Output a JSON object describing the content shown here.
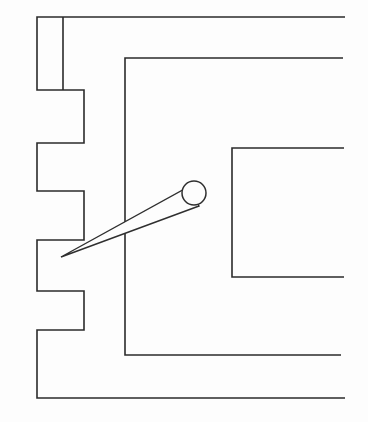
{
  "image": {
    "title": "Scanned line drawing",
    "subject": "floor-plan-outline-with-pointer",
    "width": 368,
    "height": 422,
    "background_color": "#fdfdfd",
    "line_color": "#2b2b2b",
    "style": "monochrome technical line drawing, scanned/faxed appearance",
    "text_labels": []
  },
  "geometry": {
    "outer_wall": {
      "name": "stepped-outer-wall",
      "description": "Open polyline forming the left stepped wall, top edge and bottom edge; both right ends run off past the right side of the frame.",
      "points": "345,17 63,17 63,90 37,90 37,17 63,17 63,90 84,90 84,143 37,143 37,191 84,191 84,240 37,240 37,291 84,291 84,330 37,330 37,398 345,398"
    },
    "outer_wall_segments": [
      {
        "name": "top-edge",
        "from": [
          345,
          17
        ],
        "to": [
          63,
          17
        ]
      },
      {
        "name": "upper-left-tab-right-side",
        "from": [
          63,
          17
        ],
        "to": [
          63,
          90
        ]
      },
      {
        "name": "upper-left-tab-bottom",
        "from": [
          63,
          90
        ],
        "to": [
          37,
          90
        ]
      },
      {
        "name": "upper-left-tab-left-side",
        "from": [
          37,
          90
        ],
        "to": [
          37,
          17
        ]
      },
      {
        "name": "step-1-top",
        "from": [
          63,
          90
        ],
        "to": [
          84,
          90
        ]
      },
      {
        "name": "step-1-right",
        "from": [
          84,
          90
        ],
        "to": [
          84,
          143
        ]
      },
      {
        "name": "step-1-bottom",
        "from": [
          84,
          143
        ],
        "to": [
          37,
          143
        ]
      },
      {
        "name": "step-2-left",
        "from": [
          37,
          143
        ],
        "to": [
          37,
          191
        ]
      },
      {
        "name": "step-2-bottom",
        "from": [
          37,
          191
        ],
        "to": [
          84,
          191
        ]
      },
      {
        "name": "step-3-right",
        "from": [
          84,
          191
        ],
        "to": [
          84,
          240
        ]
      },
      {
        "name": "step-3-bottom",
        "from": [
          84,
          240
        ],
        "to": [
          37,
          240
        ]
      },
      {
        "name": "step-4-left",
        "from": [
          37,
          240
        ],
        "to": [
          37,
          291
        ]
      },
      {
        "name": "step-4-bottom",
        "from": [
          37,
          291
        ],
        "to": [
          84,
          291
        ]
      },
      {
        "name": "step-5-right",
        "from": [
          84,
          291
        ],
        "to": [
          84,
          330
        ]
      },
      {
        "name": "step-5-bottom",
        "from": [
          84,
          330
        ],
        "to": [
          37,
          330
        ]
      },
      {
        "name": "lower-left-side",
        "from": [
          37,
          330
        ],
        "to": [
          37,
          398
        ]
      },
      {
        "name": "bottom-edge",
        "from": [
          37,
          398
        ],
        "to": [
          345,
          398
        ]
      }
    ],
    "inner_wall": {
      "name": "inner-partition-wall",
      "description": "Large inner rectangle open at the right: runs from upper right, left to x=125, down, then right to the lower right.",
      "points": "343,58 125,58 125,355 341,355"
    },
    "right_room": {
      "name": "right-room-outline",
      "description": "Smaller room outline open on the right side: top edge from right running left to x=232, down to y=277, then right off frame.",
      "points": "344,148 232,148 232,277 344,277"
    },
    "pointer": {
      "name": "leader-pointer-cone",
      "description": "Tapering cone (leader line) running from a sharp tip at the left step corner up and right to a small circle.",
      "tip": [
        61,
        257
      ],
      "upper_edge_end": [
        190,
        186
      ],
      "lower_edge_end": [
        199,
        206
      ],
      "polygon": "61,257 190,186 199,206",
      "circle": {
        "cx": 194,
        "cy": 193,
        "r": 12
      }
    }
  },
  "render": {
    "line_width": 1.6,
    "pointer_line_width": 1.4,
    "circle_line_width": 1.5
  }
}
